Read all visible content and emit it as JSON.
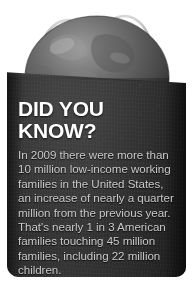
{
  "graphic": {
    "type": "did-you-know-infographic",
    "background_color": "#ffffff",
    "bag": {
      "name": "shopping-bag",
      "color": "#2e2e2e",
      "handle_color": "#b4b4b4"
    },
    "globe": {
      "name": "earth-globe",
      "color": "#6e6e6e",
      "description": "grayscale Earth sitting inside the bag"
    }
  },
  "callout": {
    "headline": "DID YOU KNOW?",
    "headline_color": "#ffffff",
    "body_color": "#c9c9c9",
    "body_lines": [
      "In 2009 there were more than",
      "10 million low-income working",
      "families in the United States,",
      "an increase of nearly a quarter",
      "million from the previous year.",
      "That's nearly 1 in 3 American",
      "families touching 45 million",
      "families, including 22 million",
      "children."
    ],
    "body_text": "In 2009 there were more than 10 million low-income working families in the United States, an increase of nearly a quarter million from the previous year. That's nearly 1 in 3 American families touching 45 million families, including 22 million children."
  }
}
